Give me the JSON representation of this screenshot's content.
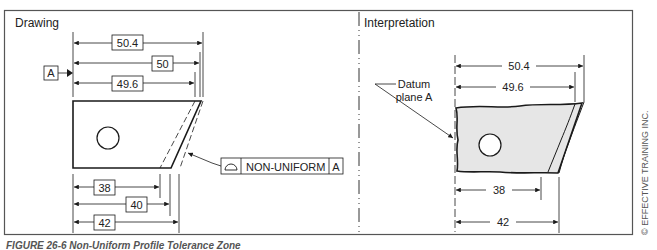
{
  "panels": {
    "drawing": {
      "title": "Drawing",
      "datum_label": "A",
      "dimensions_top": [
        "50.4",
        "50",
        "49.6"
      ],
      "dimensions_bottom": [
        "38",
        "40",
        "42"
      ],
      "feature_control_frame": {
        "symbol": "profile-of-surface",
        "modifier": "NON-UNIFORM",
        "datum": "A"
      }
    },
    "interpretation": {
      "title": "Interpretation",
      "datum_callout_line1": "Datum",
      "datum_callout_line2": "plane A",
      "datum_label": "A",
      "dimensions_top": [
        "50.4",
        "49.6"
      ],
      "dimensions_bottom": [
        "38",
        "42"
      ]
    }
  },
  "caption": "FIGURE 26-6  Non-Uniform Profile Tolerance Zone",
  "copyright": "© EFFECTIVE TRAINING INC.",
  "colors": {
    "line": "#1a1a1a",
    "part_fill": "#e6e6e6",
    "frame": "#555555"
  }
}
